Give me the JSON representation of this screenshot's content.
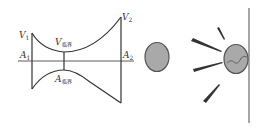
{
  "diagram": {
    "nozzle": {
      "labels": {
        "v1": "V",
        "v1_sub": "1",
        "v2": "V",
        "v2_sub": "2",
        "a1": "A",
        "a1_sub": "1",
        "a2": "A",
        "a2_sub": "2",
        "vcrit": "V",
        "vcrit_sub": "临界",
        "acrit": "A",
        "acrit_sub": "临界"
      }
    },
    "colors": {
      "line": "#333333",
      "ball_fill": "#a9a9a9",
      "ball_stroke": "#555555",
      "wall": "#777777"
    }
  }
}
